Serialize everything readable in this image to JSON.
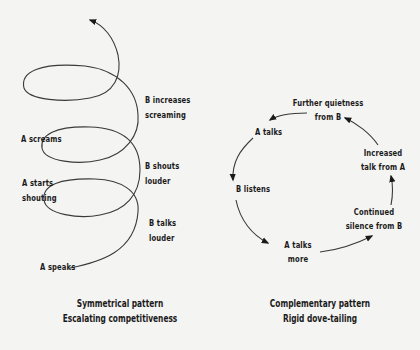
{
  "symmetrical": {
    "labels": {
      "a_speaks": "A speaks",
      "b_talks_louder_1": "B talks",
      "b_talks_louder_2": "louder",
      "a_starts_shouting_1": "A starts",
      "a_starts_shouting_2": "shouting",
      "b_shouts_louder_1": "B shouts",
      "b_shouts_louder_2": "louder",
      "a_screams": "A screams",
      "b_increases_screaming_1": "B increases",
      "b_increases_screaming_2": "screaming"
    },
    "caption": {
      "line1": "Symmetrical pattern",
      "line2": "Escalating competitiveness"
    }
  },
  "complementary": {
    "labels": {
      "a_talks": "A talks",
      "further_quietness_1": "Further quietness",
      "further_quietness_2": "from B",
      "increased_talk_1": "Increased",
      "increased_talk_2": "talk from A",
      "continued_silence_1": "Continued",
      "continued_silence_2": "silence from B",
      "a_talks_more_1": "A talks",
      "a_talks_more_2": "more",
      "b_listens": "B listens"
    },
    "caption": {
      "line1": "Complementary pattern",
      "line2": "Rigid dove-tailing"
    }
  },
  "colors": {
    "background": "#f4f4f2",
    "ink": "#1a1a1a",
    "line": "#3a3a3a"
  }
}
